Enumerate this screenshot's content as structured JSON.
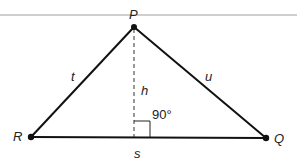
{
  "diagram": {
    "type": "triangle",
    "vertices": {
      "P": {
        "label": "P",
        "x": 134,
        "y": 27
      },
      "R": {
        "label": "R",
        "x": 31,
        "y": 137
      },
      "Q": {
        "label": "Q",
        "x": 266,
        "y": 138
      }
    },
    "sides": {
      "t": {
        "label": "t",
        "from": "R",
        "to": "P"
      },
      "u": {
        "label": "u",
        "from": "P",
        "to": "Q"
      },
      "s": {
        "label": "s",
        "from": "R",
        "to": "Q"
      }
    },
    "altitude": {
      "label": "h",
      "from": "P",
      "foot_x": 134,
      "foot_y": 137,
      "style": "dashed"
    },
    "right_angle": {
      "label": "90°"
    },
    "colors": {
      "line": "#111111",
      "top_rule": "#c8c8c8"
    }
  }
}
